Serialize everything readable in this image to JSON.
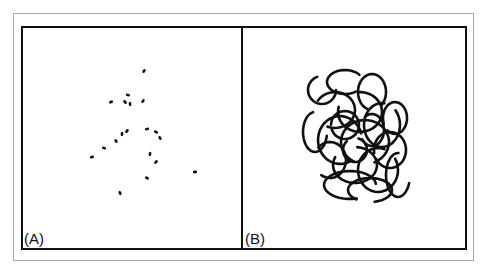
{
  "figure": {
    "colors": {
      "frame_outer": "#a8a8a8",
      "frame_inner": "#111111",
      "ink": "#111111",
      "background": "#ffffff"
    },
    "panels": [
      {
        "label": "(A)",
        "description": "sparse scattered short dashes",
        "points": [
          [
            144,
            71
          ],
          [
            111,
            102
          ],
          [
            128,
            95
          ],
          [
            125,
            102
          ],
          [
            130,
            104
          ],
          [
            143,
            101
          ],
          [
            92,
            157
          ],
          [
            104,
            148
          ],
          [
            116,
            141
          ],
          [
            122,
            134
          ],
          [
            127,
            131
          ],
          [
            147,
            129
          ],
          [
            156,
            132
          ],
          [
            160,
            138
          ],
          [
            150,
            154
          ],
          [
            156,
            162
          ],
          [
            195,
            172
          ],
          [
            147,
            178
          ],
          [
            120,
            193
          ]
        ]
      },
      {
        "label": "(B)",
        "description": "dense tangle of overlapping looped trajectories",
        "center": [
          355,
          135
        ],
        "loops": [
          [
            322,
            90,
            14,
            14
          ],
          [
            345,
            82,
            18,
            12
          ],
          [
            372,
            92,
            14,
            18
          ],
          [
            395,
            118,
            12,
            16
          ],
          [
            335,
            110,
            20,
            18
          ],
          [
            360,
            112,
            22,
            20
          ],
          [
            382,
            125,
            18,
            22
          ],
          [
            315,
            132,
            12,
            20
          ],
          [
            340,
            140,
            22,
            24
          ],
          [
            365,
            142,
            24,
            22
          ],
          [
            390,
            150,
            16,
            18
          ],
          [
            330,
            160,
            16,
            18
          ],
          [
            355,
            165,
            22,
            18
          ],
          [
            378,
            170,
            20,
            22
          ],
          [
            398,
            175,
            12,
            22
          ],
          [
            350,
            185,
            26,
            14
          ],
          [
            370,
            190,
            22,
            12
          ],
          [
            345,
            125,
            14,
            14
          ],
          [
            372,
            130,
            12,
            16
          ],
          [
            355,
            150,
            12,
            12
          ]
        ]
      }
    ]
  }
}
